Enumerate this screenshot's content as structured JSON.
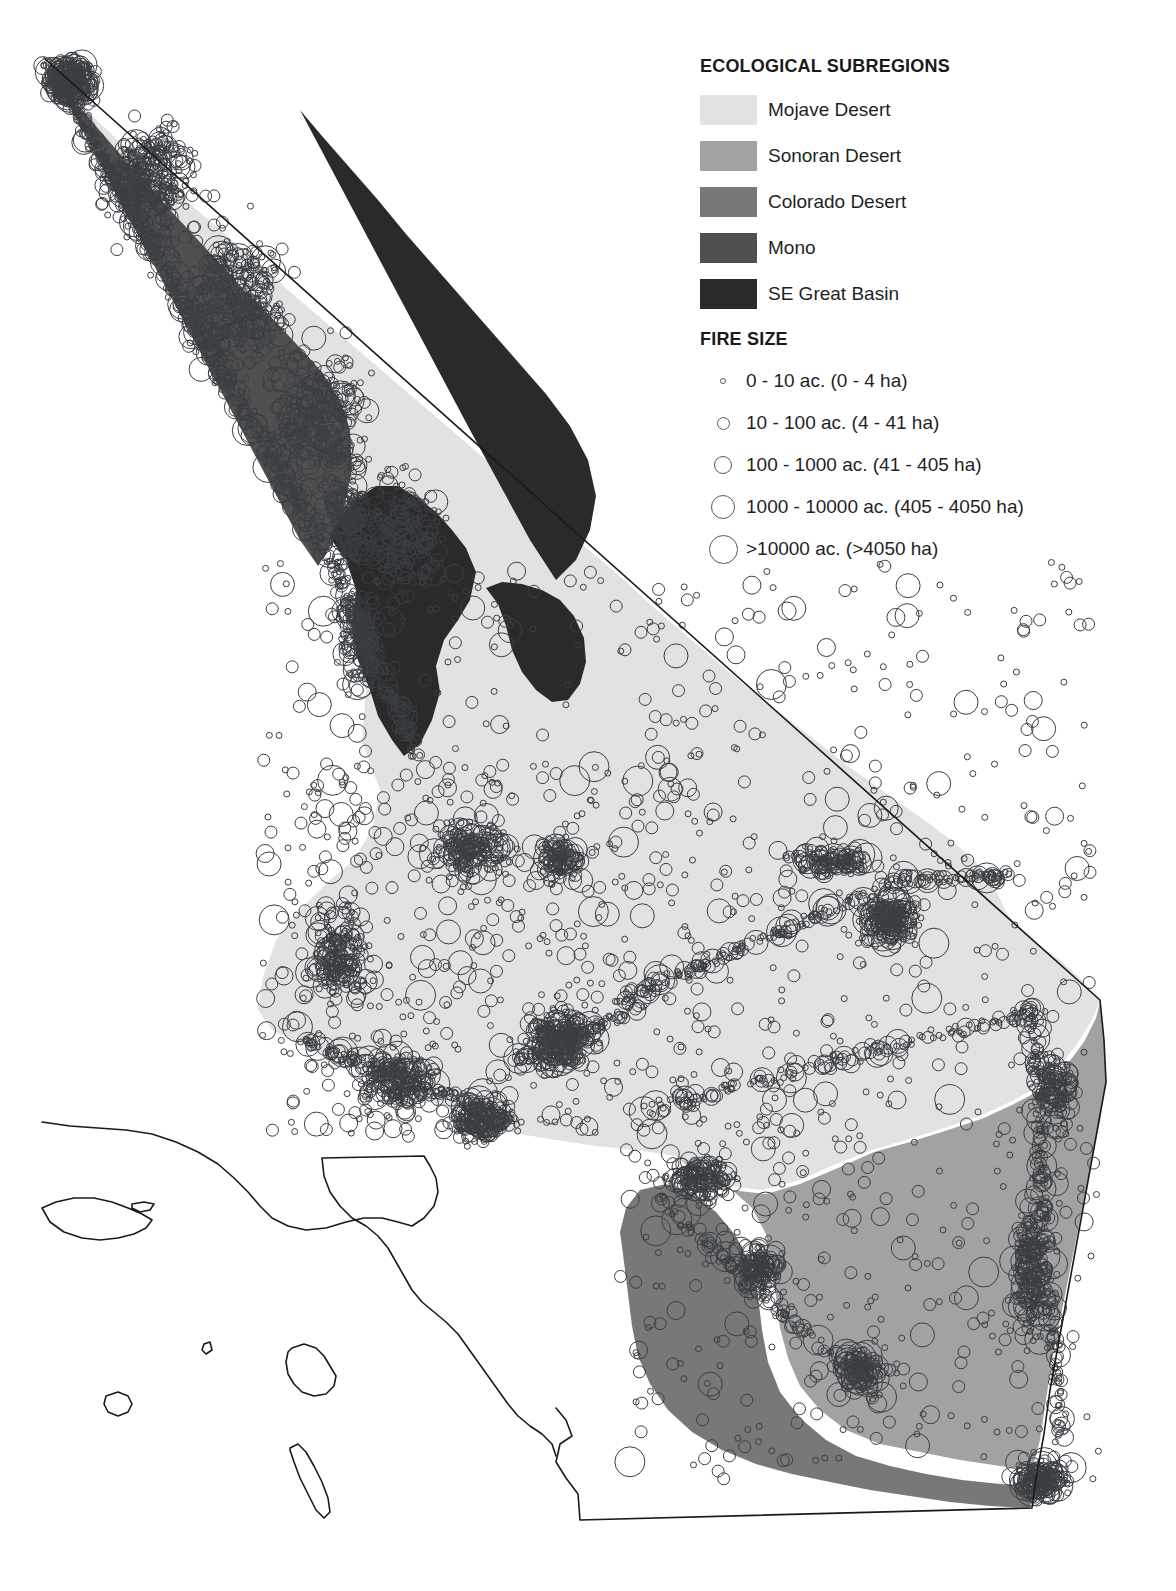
{
  "legend": {
    "subregions_title": "ECOLOGICAL SUBREGIONS",
    "subregions": [
      {
        "label": "Mojave Desert",
        "color": "#e2e2e2"
      },
      {
        "label": "Sonoran Desert",
        "color": "#a2a2a2"
      },
      {
        "label": "Colorado Desert",
        "color": "#787878"
      },
      {
        "label": "Mono",
        "color": "#4f4f4f"
      },
      {
        "label": "SE Great Basin",
        "color": "#2a2a2a"
      }
    ],
    "fire_size_title": "FIRE SIZE",
    "fire_sizes": [
      {
        "label": "0 - 10 ac. (0 - 4 ha)",
        "diameter": 6
      },
      {
        "label": "10 - 100 ac. (4 - 41 ha)",
        "diameter": 13
      },
      {
        "label": "100 - 1000 ac. (41 - 405 ha)",
        "diameter": 18
      },
      {
        "label": "1000 - 10000 ac. (405 - 4050 ha)",
        "diameter": 24
      },
      {
        "label": ">10000 ac. (>4050 ha)",
        "diameter": 29
      }
    ]
  },
  "map_style": {
    "background": "#ffffff",
    "outline_color": "#1a1a1a",
    "outline_width": 1.6,
    "fire_stroke": "#3a3e42",
    "fire_stroke_width": 1.0
  },
  "chart_data": {
    "type": "map",
    "title": "ECOLOGICAL SUBREGIONS",
    "region_fills": {
      "mojave": "#e2e2e2",
      "sonoran": "#a2a2a2",
      "colorado": "#787878",
      "mono": "#4f4f4f",
      "se_great_basin": "#2a2a2a"
    },
    "polygons": {
      "mojave": "M 62,72 L 252,430 L 300,492 L 330,540 L 352,560 L 360,600 L 352,640 L 366,690 L 362,742 L 380,790 L 372,830 L 352,862 L 330,880 L 300,910 L 276,940 L 262,980 L 258,1010 L 272,1030 L 300,1044 L 330,1056 L 360,1070 L 392,1086 L 420,1098 L 452,1110 L 486,1126 L 520,1134 L 556,1140 L 596,1146 L 636,1150 L 676,1156 L 700,1172 L 728,1186 L 762,1190 L 800,1180 L 836,1164 L 872,1150 L 906,1140 L 944,1128 L 980,1116 L 1010,1102 L 1040,1086 L 1062,1064 L 1080,1040 L 1094,1016 L 1100,1000 L 1082,980 L 1060,960 L 1040,946 L 1020,930 L 1006,912 L 996,890 L 980,866 L 956,844 L 930,824 L 904,806 L 876,786 L 848,766 L 820,744 L 792,722 L 764,700 L 736,678 L 708,654 L 680,630 L 652,606 L 624,580 L 596,556 L 568,532 L 540,508 L 512,484 L 484,458 L 456,434 L 428,410 L 400,386 L 372,362 L 344,338 L 316,314 L 288,290 L 260,264 L 232,240 L 204,216 L 176,192 L 148,166 L 120,142 L 92,116 L 62,72 Z",
      "mono": "M 46,62 L 300,540 L 318,566 L 332,544 L 344,508 L 352,470 L 350,430 L 340,400 L 322,372 L 300,348 L 276,322 L 250,296 L 224,268 L 198,240 L 172,212 L 146,184 L 120,154 L 94,124 L 68,92 L 46,62 Z",
      "se_great_basin_1": "M 330,538 L 346,560 L 356,590 L 352,626 L 358,660 L 370,690 L 378,716 L 392,740 L 404,756 L 420,744 L 432,720 L 440,692 L 436,666 L 444,640 L 458,620 L 470,600 L 476,572 L 466,548 L 452,530 L 436,512 L 418,498 L 398,486 L 376,486 L 356,500 L 340,518 L 330,538 Z",
      "se_great_basin_2": "M 486,588 L 498,604 L 506,626 L 512,650 L 522,672 L 536,690 L 552,702 L 568,700 L 580,684 L 586,662 L 584,638 L 574,616 L 560,600 L 542,590 L 522,584 L 502,582 L 486,588 Z",
      "se_great_basin_3": "M 300,110 L 470,430 L 530,540 L 556,580 L 576,560 L 590,530 L 596,496 L 588,460 L 570,426 L 546,394 L 518,362 L 490,330 L 462,298 L 434,266 L 406,234 L 378,200 L 350,168 L 322,136 L 300,110 Z",
      "sonoran": "M 676,1156 L 700,1176 L 730,1190 L 766,1194 L 800,1184 L 838,1168 L 874,1152 L 910,1142 L 948,1130 L 984,1118 L 1014,1104 L 1044,1088 L 1066,1066 L 1084,1042 L 1096,1018 L 1100,1002 L 1104,1040 L 1106,1080 L 1100,1120 L 1092,1160 L 1084,1200 L 1076,1240 L 1068,1280 L 1060,1320 L 1052,1360 L 1046,1400 L 1040,1440 L 1032,1470 L 1000,1466 L 960,1460 L 920,1452 L 880,1444 L 846,1430 L 820,1410 L 800,1386 L 788,1358 L 780,1328 L 776,1296 L 772,1264 L 766,1234 L 752,1208 L 730,1188 L 704,1174 L 676,1156 Z",
      "colorado": "M 640,1190 L 666,1184 L 692,1194 L 716,1212 L 736,1236 L 750,1264 L 758,1296 L 762,1330 L 768,1362 L 780,1392 L 800,1418 L 826,1440 L 856,1456 L 890,1466 L 926,1474 L 962,1480 L 1000,1484 L 1034,1486 L 1030,1508 L 990,1506 L 950,1502 L 910,1496 L 870,1490 L 830,1482 L 792,1474 L 756,1464 L 722,1450 L 692,1432 L 668,1410 L 650,1384 L 638,1356 L 632,1326 L 628,1294 L 624,1262 L 620,1232 L 626,1208 L 640,1190 Z"
    }
  },
  "fire_generation": {
    "note": "Fire occurrence points rendered as hollow circles sized by burn-area class.",
    "seed": 20250117,
    "total_points": 4200,
    "size_classes_px": [
      3,
      6,
      9,
      12,
      15
    ],
    "clusters": [
      {
        "cx": 70,
        "cy": 82,
        "rx": 26,
        "ry": 26,
        "n": 320,
        "big": 0.3
      },
      {
        "cx": 150,
        "cy": 180,
        "rx": 55,
        "ry": 70,
        "n": 300,
        "big": 0.22
      },
      {
        "cx": 235,
        "cy": 300,
        "rx": 60,
        "ry": 85,
        "n": 320,
        "big": 0.2
      },
      {
        "cx": 320,
        "cy": 420,
        "rx": 62,
        "ry": 90,
        "n": 300,
        "big": 0.2
      },
      {
        "cx": 400,
        "cy": 540,
        "rx": 55,
        "ry": 80,
        "n": 200,
        "big": 0.22
      },
      {
        "cx": 345,
        "cy": 520,
        "rx": 30,
        "ry": 60,
        "n": 150,
        "big": 0.26
      },
      {
        "cx": 360,
        "cy": 640,
        "rx": 26,
        "ry": 55,
        "n": 120,
        "big": 0.24
      },
      {
        "cx": 340,
        "cy": 960,
        "rx": 38,
        "ry": 55,
        "n": 180,
        "big": 0.3
      },
      {
        "cx": 400,
        "cy": 1080,
        "rx": 55,
        "ry": 38,
        "n": 200,
        "big": 0.28
      },
      {
        "cx": 480,
        "cy": 1120,
        "rx": 40,
        "ry": 26,
        "n": 160,
        "big": 0.3
      },
      {
        "cx": 560,
        "cy": 1040,
        "rx": 40,
        "ry": 36,
        "n": 260,
        "big": 0.26
      },
      {
        "cx": 470,
        "cy": 850,
        "rx": 44,
        "ry": 36,
        "n": 170,
        "big": 0.26
      },
      {
        "cx": 560,
        "cy": 860,
        "rx": 30,
        "ry": 26,
        "n": 110,
        "big": 0.28
      },
      {
        "cx": 890,
        "cy": 920,
        "rx": 36,
        "ry": 30,
        "n": 210,
        "big": 0.26
      },
      {
        "cx": 830,
        "cy": 862,
        "rx": 55,
        "ry": 16,
        "n": 130,
        "big": 0.22
      },
      {
        "cx": 700,
        "cy": 1180,
        "rx": 40,
        "ry": 30,
        "n": 150,
        "big": 0.26
      },
      {
        "cx": 760,
        "cy": 1270,
        "rx": 30,
        "ry": 30,
        "n": 140,
        "big": 0.28
      },
      {
        "cx": 860,
        "cy": 1370,
        "rx": 30,
        "ry": 26,
        "n": 110,
        "big": 0.26
      },
      {
        "cx": 1040,
        "cy": 1480,
        "rx": 34,
        "ry": 24,
        "n": 180,
        "big": 0.3
      },
      {
        "cx": 1030,
        "cy": 1270,
        "rx": 22,
        "ry": 80,
        "n": 200,
        "big": 0.26
      },
      {
        "cx": 1055,
        "cy": 1090,
        "rx": 24,
        "ry": 50,
        "n": 120,
        "big": 0.26
      }
    ],
    "scatter_fields": [
      {
        "x0": 260,
        "y0": 560,
        "x1": 1090,
        "y1": 1150,
        "n": 620,
        "big": 0.22
      },
      {
        "x0": 620,
        "y0": 1120,
        "x1": 1100,
        "y1": 1480,
        "n": 260,
        "big": 0.2
      },
      {
        "x0": 280,
        "y0": 760,
        "x1": 700,
        "y1": 1140,
        "n": 300,
        "big": 0.24
      }
    ],
    "corridors": [
      {
        "x0": 620,
        "y0": 1000,
        "x1": 900,
        "y1": 880,
        "n": 150,
        "spread": 9,
        "big": 0.2
      },
      {
        "x0": 900,
        "y0": 880,
        "x1": 1010,
        "y1": 876,
        "n": 70,
        "spread": 7,
        "big": 0.2
      },
      {
        "x0": 520,
        "y0": 1060,
        "x1": 640,
        "y1": 1006,
        "n": 70,
        "spread": 8,
        "big": 0.2
      },
      {
        "x0": 640,
        "y0": 1110,
        "x1": 1040,
        "y1": 1010,
        "n": 150,
        "spread": 10,
        "big": 0.2
      },
      {
        "x0": 300,
        "y0": 1040,
        "x1": 520,
        "y1": 1120,
        "n": 120,
        "spread": 10,
        "big": 0.24
      },
      {
        "x0": 1030,
        "y0": 1000,
        "x1": 1060,
        "y1": 1440,
        "n": 180,
        "spread": 9,
        "big": 0.24
      },
      {
        "x0": 660,
        "y0": 1200,
        "x1": 880,
        "y1": 1400,
        "n": 110,
        "spread": 10,
        "big": 0.24
      },
      {
        "x0": 46,
        "y0": 60,
        "x1": 330,
        "y1": 560,
        "n": 420,
        "spread": 13,
        "big": 0.22
      },
      {
        "x0": 330,
        "y0": 560,
        "x1": 420,
        "y1": 760,
        "n": 150,
        "spread": 12,
        "big": 0.24
      }
    ]
  }
}
